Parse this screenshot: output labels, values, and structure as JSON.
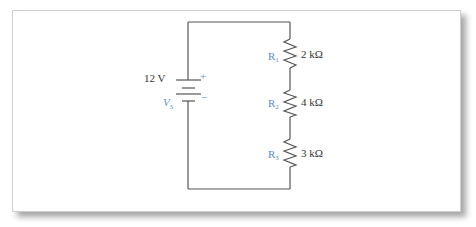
{
  "circuit": {
    "type": "series",
    "source": {
      "name": "V",
      "subscript": "S",
      "value": "12 V",
      "plus_sign": "+",
      "minus_sign": "−"
    },
    "resistors": [
      {
        "name": "R",
        "subscript": "1",
        "value": "2 kΩ"
      },
      {
        "name": "R",
        "subscript": "2",
        "value": "4 kΩ"
      },
      {
        "name": "R",
        "subscript": "3",
        "value": "3 kΩ"
      }
    ],
    "colors": {
      "wire": "#555555",
      "label_accent": "#5b8bc9",
      "text": "#333333",
      "frame_border": "#cfcfcf"
    }
  }
}
